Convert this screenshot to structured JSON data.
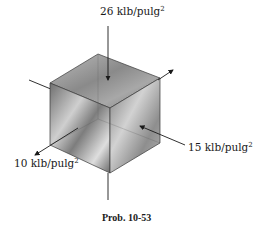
{
  "diagram": {
    "labels": {
      "top_stress": "26 klb/pulg",
      "right_stress": "15 klb/pulg",
      "left_stress": "10 klb/pulg",
      "superscript": "2"
    },
    "caption": "Prob. 10-53",
    "colors": {
      "line": "#1a1a1a",
      "face_top": "#9a9a9a",
      "face_left": "#8c8c8c",
      "face_right": "#a5a5a5",
      "edge": "#3a3a3a"
    }
  }
}
